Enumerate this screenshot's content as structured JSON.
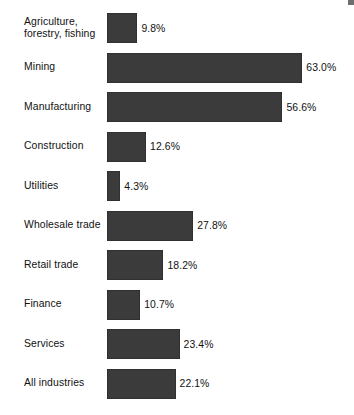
{
  "chart_data": {
    "type": "bar",
    "orientation": "horizontal",
    "title": "",
    "subtitle": "",
    "xlabel": "",
    "ylabel": "",
    "grid": false,
    "legend": null,
    "axis_visible": false,
    "value_suffix": "%",
    "xlim": [
      0,
      63.0
    ],
    "categories": [
      "Agriculture,\nforestry, fishing",
      "Mining",
      "Manufacturing",
      "Construction",
      "Utilities",
      "Wholesale trade",
      "Retail trade",
      "Finance",
      "Services",
      "All industries"
    ],
    "values": [
      9.8,
      63.0,
      56.6,
      12.6,
      4.3,
      27.8,
      18.2,
      10.7,
      23.4,
      22.1
    ],
    "value_labels": [
      "9.8%",
      "63.0%",
      "56.6%",
      "12.6%",
      "4.3%",
      "27.8%",
      "18.2%",
      "10.7%",
      "23.4%",
      "22.1%"
    ],
    "bar_color": "#3b3b3b",
    "background_color": "#ffffff",
    "text_color": "#111111"
  },
  "scale": {
    "pixels_per_percent": 3.1,
    "bar_origin_x": 107
  },
  "artifacts": {
    "corner_mark": "scan-artifact"
  }
}
